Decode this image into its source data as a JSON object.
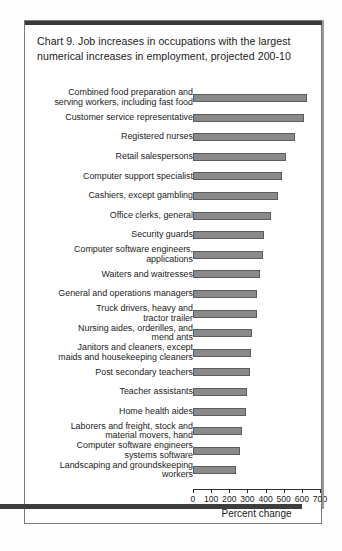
{
  "chart_title": "Chart 9. Job increases in occupations with the largest numerical increases in employment, projected 200-10",
  "chart_data": {
    "type": "bar",
    "orientation": "horizontal",
    "title": "Chart 9. Job increases in occupations with the largest numerical increases in employment, projected 200-10",
    "xlabel": "Percent change",
    "ylabel": "",
    "xlim": [
      0,
      700
    ],
    "xticks": [
      0,
      100,
      200,
      300,
      400,
      500,
      600,
      700
    ],
    "xtick_labels": [
      "0",
      "100",
      "200",
      "300",
      "400",
      "500",
      "600",
      "700"
    ],
    "grid": false,
    "legend": null,
    "bar_color": "#8a8a8a",
    "bar_edge_color": "#5c5c5c",
    "categories": [
      "Combined food preparation and\nserving workers, including fast food",
      "Customer service representative",
      "Registered nurses",
      "Retail salespersons",
      "Computer support specialist",
      "Cashiers, except gambling",
      "Office clerks, general",
      "Security guards",
      "Computer software engineers,\napplications",
      "Waiters and waitresses",
      "General and operations managers",
      "Truck drivers, heavy and\ntractor trailer",
      "Nursing aides, orderilles, and\nmend ants",
      "Janitors and cleaners, except\nmaids and housekeeping cleaners",
      "Post secondary teachers",
      "Teacher assistants",
      "Home health aides",
      "Laborers and freight, stock and\nmaterial movers, hand",
      "Computer software engineers\nsystems software",
      "Landscaping and groundskeeping\nworkers"
    ],
    "values": [
      630,
      610,
      560,
      510,
      490,
      470,
      430,
      390,
      385,
      370,
      355,
      350,
      325,
      320,
      315,
      300,
      290,
      270,
      260,
      235
    ]
  },
  "axis": {
    "x_title": "Percent change"
  }
}
